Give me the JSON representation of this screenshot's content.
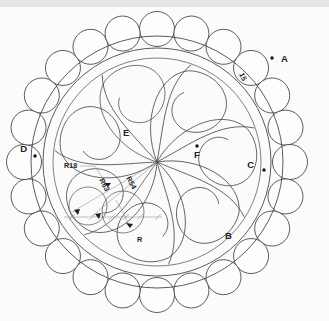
{
  "drawing": {
    "title_labels": {
      "A": "A",
      "B": "B",
      "C": "C",
      "D": "D",
      "E": "E",
      "F": "F"
    },
    "dimensions": [
      {
        "id": "band-width",
        "text": "15",
        "rotated": true
      },
      {
        "id": "radius-18",
        "text": "R18"
      },
      {
        "id": "radius-63",
        "text": "R63",
        "rotated": true
      },
      {
        "id": "radius-54",
        "text": "R54",
        "rotated": true
      },
      {
        "id": "radius-r",
        "text": "R"
      }
    ],
    "colors": {
      "background": "#fbfbfb",
      "top_strip": "#e6e6e6",
      "line": "#3d3d42",
      "dimension_line": "#8b8b90",
      "marker": "#151518"
    },
    "geometry": {
      "center_x": 157,
      "center_y": 162,
      "outer_ring_balls": 24,
      "ball_radius": 17.5,
      "ball_ring_radius": 133,
      "band_outer_radius": 126,
      "band_inner_radius": 114,
      "inner_field_radius": 104,
      "petal_count": 7
    }
  }
}
